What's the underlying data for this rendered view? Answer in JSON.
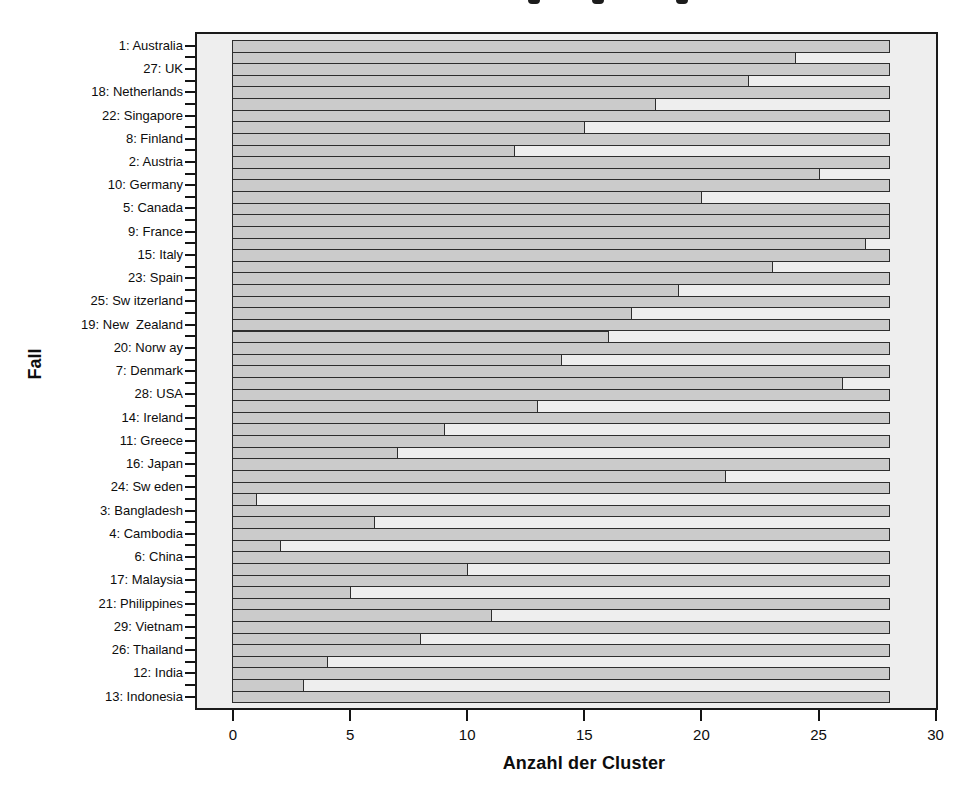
{
  "figure": {
    "x_axis_title": "Anzahl der Cluster",
    "y_axis_title": "Fall",
    "cropped_title_fragment_count": 3
  },
  "chart_data": {
    "type": "bar",
    "subtype": "horizontal-icicle-plot",
    "orientation": "horizontal",
    "xlabel": "Anzahl der Cluster",
    "ylabel": "Fall",
    "xlim": [
      0,
      30
    ],
    "xticks": [
      0,
      5,
      10,
      15,
      20,
      25,
      30
    ],
    "grid": false,
    "legend": false,
    "full_bar_value": 28,
    "rows": [
      {
        "label": "1: Australia",
        "value": 28
      },
      {
        "label": "",
        "value": 24
      },
      {
        "label": "27: UK",
        "value": 28
      },
      {
        "label": "",
        "value": 22
      },
      {
        "label": "18: Netherlands",
        "value": 28
      },
      {
        "label": "",
        "value": 18
      },
      {
        "label": "22: Singapore",
        "value": 28
      },
      {
        "label": "",
        "value": 15
      },
      {
        "label": "8: Finland",
        "value": 28
      },
      {
        "label": "",
        "value": 12
      },
      {
        "label": "2: Austria",
        "value": 28
      },
      {
        "label": "",
        "value": 25
      },
      {
        "label": "10: Germany",
        "value": 28
      },
      {
        "label": "",
        "value": 20
      },
      {
        "label": "5: Canada",
        "value": 28
      },
      {
        "label": "",
        "value": 28
      },
      {
        "label": "9: France",
        "value": 28
      },
      {
        "label": "",
        "value": 27
      },
      {
        "label": "15: Italy",
        "value": 28
      },
      {
        "label": "",
        "value": 23
      },
      {
        "label": "23: Spain",
        "value": 28
      },
      {
        "label": "",
        "value": 19
      },
      {
        "label": "25: Sw itzerland",
        "value": 28
      },
      {
        "label": "",
        "value": 17
      },
      {
        "label": "19: New  Zealand",
        "value": 28
      },
      {
        "label": "",
        "value": 16
      },
      {
        "label": "20: Norw ay",
        "value": 28
      },
      {
        "label": "",
        "value": 14
      },
      {
        "label": "7: Denmark",
        "value": 28
      },
      {
        "label": "",
        "value": 26
      },
      {
        "label": "28: USA",
        "value": 28
      },
      {
        "label": "",
        "value": 13
      },
      {
        "label": "14: Ireland",
        "value": 28
      },
      {
        "label": "",
        "value": 9
      },
      {
        "label": "11: Greece",
        "value": 28
      },
      {
        "label": "",
        "value": 7
      },
      {
        "label": "16: Japan",
        "value": 28
      },
      {
        "label": "",
        "value": 21
      },
      {
        "label": "24: Sw eden",
        "value": 28
      },
      {
        "label": "",
        "value": 1
      },
      {
        "label": "3: Bangladesh",
        "value": 28
      },
      {
        "label": "",
        "value": 6
      },
      {
        "label": "4: Cambodia",
        "value": 28
      },
      {
        "label": "",
        "value": 2
      },
      {
        "label": "6: China",
        "value": 28
      },
      {
        "label": "",
        "value": 10
      },
      {
        "label": "17: Malaysia",
        "value": 28
      },
      {
        "label": "",
        "value": 5
      },
      {
        "label": "21: Philippines",
        "value": 28
      },
      {
        "label": "",
        "value": 11
      },
      {
        "label": "29: Vietnam",
        "value": 28
      },
      {
        "label": "",
        "value": 8
      },
      {
        "label": "26: Thailand",
        "value": 28
      },
      {
        "label": "",
        "value": 4
      },
      {
        "label": "12: India",
        "value": 28
      },
      {
        "label": "",
        "value": 3
      },
      {
        "label": "13: Indonesia",
        "value": 28
      }
    ],
    "colors": {
      "bar_fill": "#cbcbcb",
      "bar_border": "#2e2e2e",
      "plot_background": "#eeeeee",
      "frame_border": "#1a1a1a",
      "page_background": "#ffffff",
      "text": "#111111"
    }
  }
}
